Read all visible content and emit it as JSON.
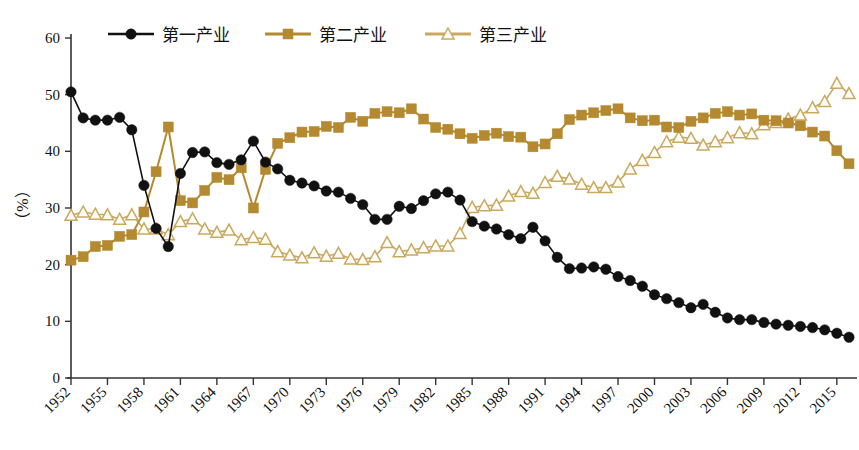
{
  "chart_data": {
    "type": "line",
    "title": "",
    "subtitle": "",
    "xlabel": "",
    "ylabel": "（%）",
    "ylim": [
      0,
      60
    ],
    "yticks": [
      0,
      10,
      20,
      30,
      40,
      50,
      60
    ],
    "xlim": [
      1952,
      2016
    ],
    "xticks": [
      1952,
      1955,
      1958,
      1961,
      1964,
      1967,
      1970,
      1973,
      1976,
      1979,
      1982,
      1985,
      1988,
      1991,
      1994,
      1997,
      2000,
      2003,
      2006,
      2009,
      2012,
      2015
    ],
    "grid": false,
    "legend_position": "top",
    "x": [
      1952,
      1953,
      1954,
      1955,
      1956,
      1957,
      1958,
      1959,
      1960,
      1961,
      1962,
      1963,
      1964,
      1965,
      1966,
      1967,
      1968,
      1969,
      1970,
      1971,
      1972,
      1973,
      1974,
      1975,
      1976,
      1977,
      1978,
      1979,
      1980,
      1981,
      1982,
      1983,
      1984,
      1985,
      1986,
      1987,
      1988,
      1989,
      1990,
      1991,
      1992,
      1993,
      1994,
      1995,
      1996,
      1997,
      1998,
      1999,
      2000,
      2001,
      2002,
      2003,
      2004,
      2005,
      2006,
      2007,
      2008,
      2009,
      2010,
      2011,
      2012,
      2013,
      2014,
      2015,
      2016
    ],
    "series": [
      {
        "name": "第一产业",
        "color": "#111111",
        "marker": "circle",
        "values": [
          50.5,
          45.9,
          45.5,
          45.5,
          46.0,
          43.8,
          34.0,
          26.4,
          23.2,
          36.1,
          39.8,
          39.9,
          38.0,
          37.7,
          38.5,
          41.8,
          38.1,
          36.9,
          34.9,
          34.4,
          33.9,
          33.0,
          32.8,
          31.7,
          30.6,
          28.0,
          28.0,
          30.3,
          29.9,
          31.3,
          32.5,
          32.8,
          31.4,
          27.6,
          26.8,
          26.3,
          25.3,
          24.6,
          26.6,
          24.2,
          21.3,
          19.3,
          19.4,
          19.6,
          19.2,
          17.9,
          17.2,
          16.2,
          14.7,
          14.0,
          13.3,
          12.4,
          13.0,
          11.6,
          10.6,
          10.3,
          10.3,
          9.8,
          9.5,
          9.3,
          9.1,
          8.9,
          8.5,
          7.9,
          7.2
        ]
      },
      {
        "name": "第二产业",
        "color": "#B4892F",
        "marker": "square",
        "values": [
          20.8,
          21.4,
          23.2,
          23.4,
          25.0,
          25.3,
          29.3,
          36.4,
          44.3,
          31.3,
          30.9,
          33.1,
          35.4,
          35.0,
          37.1,
          30.0,
          36.8,
          41.4,
          42.4,
          43.4,
          43.5,
          44.4,
          44.2,
          46.0,
          45.3,
          46.7,
          47.0,
          46.8,
          47.5,
          45.7,
          44.2,
          43.9,
          43.1,
          42.3,
          42.8,
          43.2,
          42.6,
          42.5,
          40.8,
          41.3,
          43.1,
          45.6,
          46.4,
          46.8,
          47.2,
          47.5,
          45.9,
          45.4,
          45.5,
          44.3,
          44.2,
          45.3,
          45.9,
          46.7,
          47.0,
          46.4,
          46.6,
          45.5,
          45.4,
          45.0,
          44.5,
          43.4,
          42.7,
          40.1,
          37.8
        ]
      },
      {
        "name": "第三产业",
        "color": "#C9A961",
        "marker": "triangle",
        "values": [
          28.7,
          29.3,
          28.9,
          28.8,
          28.0,
          28.8,
          26.3,
          26.3,
          25.3,
          27.6,
          28.1,
          26.3,
          25.7,
          26.1,
          24.4,
          24.8,
          24.5,
          22.3,
          21.7,
          21.2,
          22.1,
          21.5,
          22.0,
          21.0,
          20.9,
          21.4,
          23.9,
          22.3,
          22.6,
          23.0,
          23.3,
          23.3,
          25.5,
          30.1,
          30.4,
          30.5,
          32.1,
          32.9,
          32.6,
          34.5,
          35.6,
          35.1,
          34.2,
          33.6,
          33.6,
          34.6,
          36.9,
          38.4,
          39.8,
          41.7,
          42.5,
          42.3,
          41.1,
          41.7,
          42.4,
          43.3,
          43.1,
          44.7,
          45.1,
          45.7,
          46.4,
          47.7,
          48.8,
          52.0,
          50.2
        ]
      }
    ]
  },
  "legend": {
    "items": [
      {
        "label": "第一产业",
        "color": "#111111",
        "marker": "circle"
      },
      {
        "label": "第二产业",
        "color": "#B4892F",
        "marker": "square"
      },
      {
        "label": "第三产业",
        "color": "#C9A961",
        "marker": "triangle"
      }
    ]
  },
  "axes": {
    "y_title": "（%）",
    "y_tick_labels": [
      "0",
      "10",
      "20",
      "30",
      "40",
      "50",
      "60"
    ],
    "x_tick_labels": [
      "1952",
      "1955",
      "1958",
      "1961",
      "1964",
      "1967",
      "1970",
      "1973",
      "1976",
      "1979",
      "1982",
      "1985",
      "1988",
      "1991",
      "1994",
      "1997",
      "2000",
      "2003",
      "2006",
      "2009",
      "2012",
      "2015"
    ]
  },
  "colors": {
    "primary_series": "#111111",
    "secondary_series": "#B4892F",
    "tertiary_series": "#C9A961",
    "axis": "#333333",
    "background": "#FFFFFF"
  }
}
